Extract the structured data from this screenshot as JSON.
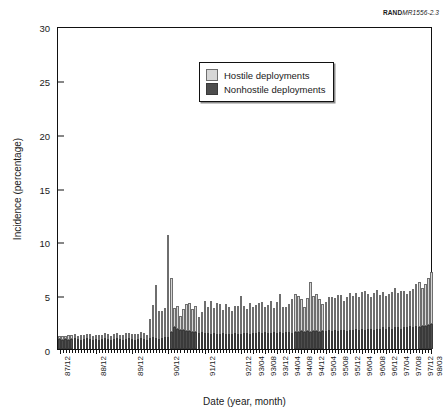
{
  "figure": {
    "source_tag_bold": "RAND",
    "source_tag_italic": "MR1556-2.3"
  },
  "legend": {
    "position": "inside-top-center",
    "items": [
      {
        "label": "Hostile deployments",
        "color": "#d6d6d6",
        "key": "hostile"
      },
      {
        "label": "Nonhostile deployments",
        "color": "#4d4d4d",
        "key": "nonhostile"
      }
    ]
  },
  "chart_data": {
    "type": "bar",
    "stacked": true,
    "title": "",
    "xlabel": "Date (year, month)",
    "ylabel": "Incidence (percentage)",
    "ylim": [
      0,
      30
    ],
    "yticks": [
      0,
      5,
      10,
      15,
      20,
      25,
      30
    ],
    "grid": false,
    "tick_labels": [
      "87/12",
      "88/12",
      "89/12",
      "90/12",
      "91/12",
      "92/12",
      "93/04",
      "93/08",
      "93/12",
      "94/04",
      "94/08",
      "94/12",
      "95/04",
      "95/08",
      "95/12",
      "96/04",
      "96/08",
      "96/12",
      "97/04",
      "97/08",
      "97/12",
      "98/03"
    ],
    "tick_label_indices": [
      0,
      12,
      24,
      36,
      48,
      60,
      64,
      68,
      72,
      76,
      80,
      84,
      88,
      92,
      96,
      100,
      104,
      108,
      112,
      116,
      120,
      123
    ],
    "n_points": 124,
    "x_start": "87/12",
    "x_end": "98/03",
    "series": [
      {
        "name": "Nonhostile deployments",
        "color": "#4d4d4d",
        "values": [
          0.9,
          0.8,
          0.9,
          0.8,
          0.9,
          1.0,
          0.9,
          0.8,
          0.9,
          1.0,
          0.9,
          0.8,
          0.9,
          0.8,
          0.9,
          1.0,
          0.9,
          0.8,
          0.9,
          1.0,
          0.9,
          0.8,
          0.9,
          1.0,
          0.9,
          0.8,
          0.9,
          1.0,
          0.9,
          0.8,
          1.0,
          1.1,
          1.0,
          0.9,
          1.0,
          1.1,
          1.1,
          1.6,
          2.0,
          1.9,
          1.8,
          1.8,
          1.7,
          1.7,
          1.6,
          1.6,
          1.5,
          1.6,
          1.5,
          1.5,
          1.4,
          1.5,
          1.4,
          1.4,
          1.5,
          1.4,
          1.4,
          1.4,
          1.5,
          1.4,
          1.4,
          1.5,
          1.5,
          1.4,
          1.5,
          1.5,
          1.6,
          1.5,
          1.6,
          1.5,
          1.5,
          1.6,
          1.5,
          1.6,
          1.5,
          1.6,
          1.6,
          1.5,
          1.6,
          1.6,
          1.7,
          1.6,
          1.7,
          1.6,
          1.7,
          1.7,
          1.6,
          1.7,
          1.7,
          1.8,
          1.7,
          1.8,
          1.7,
          1.8,
          1.8,
          1.7,
          1.8,
          1.8,
          1.9,
          1.8,
          1.9,
          1.8,
          1.9,
          1.9,
          1.8,
          1.9,
          1.9,
          2.0,
          1.9,
          2.0,
          1.9,
          2.0,
          2.0,
          1.9,
          2.0,
          2.0,
          2.1,
          2.0,
          2.1,
          2.0,
          2.1,
          2.1,
          2.2,
          2.3
        ]
      },
      {
        "name": "Hostile deployments",
        "color": "#d6d6d6",
        "values": [
          0.3,
          0.4,
          0.3,
          0.5,
          0.4,
          0.4,
          0.3,
          0.5,
          0.4,
          0.4,
          0.5,
          0.4,
          0.4,
          0.5,
          0.4,
          0.5,
          0.5,
          0.4,
          0.5,
          0.5,
          0.4,
          0.5,
          0.6,
          0.5,
          0.5,
          0.6,
          0.5,
          0.6,
          0.6,
          0.5,
          1.8,
          3.0,
          4.9,
          2.6,
          2.5,
          2.7,
          9.5,
          5.0,
          1.8,
          2.1,
          1.3,
          1.9,
          2.5,
          2.6,
          2.1,
          2.4,
          1.5,
          1.8,
          3.0,
          2.4,
          3.1,
          2.3,
          2.9,
          2.8,
          2.1,
          2.8,
          2.5,
          2.1,
          2.5,
          2.6,
          3.5,
          2.5,
          2.2,
          2.9,
          2.4,
          2.6,
          2.7,
          2.9,
          2.3,
          2.6,
          3.0,
          2.2,
          2.9,
          3.5,
          2.4,
          2.3,
          2.6,
          3.1,
          3.5,
          3.3,
          2.9,
          2.3,
          3.0,
          4.6,
          3.2,
          3.4,
          3.0,
          2.5,
          2.7,
          3.0,
          3.1,
          2.9,
          3.3,
          3.2,
          2.7,
          3.1,
          3.4,
          3.1,
          3.3,
          3.0,
          3.4,
          3.6,
          3.2,
          2.9,
          3.4,
          3.6,
          3.1,
          3.3,
          3.0,
          3.1,
          3.4,
          3.7,
          3.2,
          3.5,
          3.4,
          3.1,
          3.3,
          3.6,
          3.9,
          4.2,
          3.6,
          3.9,
          4.4,
          4.9
        ]
      }
    ]
  }
}
